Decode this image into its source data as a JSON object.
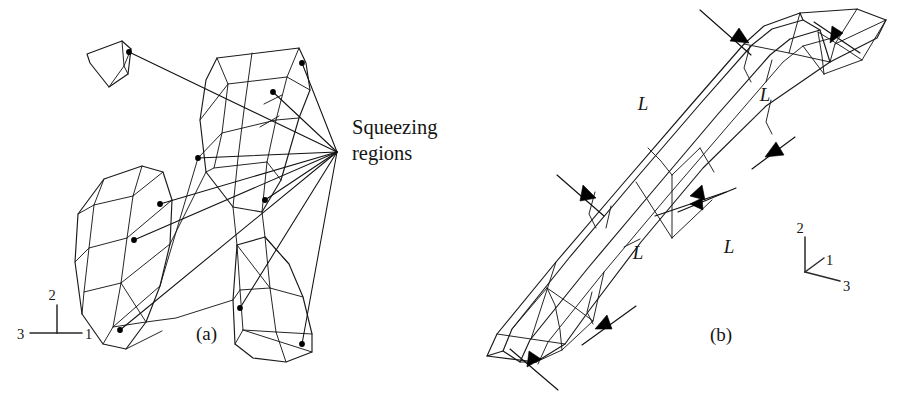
{
  "figure": {
    "background_color": "#ffffff",
    "ink_color": "#1a1a1a",
    "width": 908,
    "height": 400
  },
  "callout": {
    "line1": "Squeezing",
    "line2": "regions",
    "anchor": {
      "x": 337,
      "y": 152
    },
    "text_x": 352,
    "text_y_line1": 134,
    "text_y_line2": 160,
    "leader_count": 10,
    "leader_targets": [
      {
        "x": 129,
        "y": 52,
        "label": "node-upper-left-wedge"
      },
      {
        "x": 302,
        "y": 63,
        "label": "node-center-block-top-right"
      },
      {
        "x": 273,
        "y": 92,
        "label": "node-center-block-mid"
      },
      {
        "x": 198,
        "y": 158,
        "label": "node-center-block-lower-left"
      },
      {
        "x": 265,
        "y": 200,
        "label": "node-center-block-lower"
      },
      {
        "x": 160,
        "y": 204,
        "label": "node-left-block-upper"
      },
      {
        "x": 134,
        "y": 240,
        "label": "node-left-block-lower"
      },
      {
        "x": 120,
        "y": 330,
        "label": "node-left-block-bottom"
      },
      {
        "x": 240,
        "y": 308,
        "label": "node-right-block-upper"
      },
      {
        "x": 302,
        "y": 344,
        "label": "node-right-block-bottom"
      }
    ]
  },
  "panel_a": {
    "label": "(a)",
    "label_x": 196,
    "label_y": 340,
    "axis_triad": {
      "origin": {
        "x": 57,
        "y": 333
      },
      "axes": [
        {
          "name": "2",
          "label": "2",
          "dir": "up",
          "tip_x": 57,
          "tip_y": 305,
          "text_x": 52,
          "text_y": 300
        },
        {
          "name": "1",
          "label": "1",
          "dir": "right",
          "tip_x": 82,
          "tip_y": 333,
          "text_x": 84,
          "text_y": 339
        },
        {
          "name": "3",
          "label": "3",
          "dir": "left",
          "tip_x": 30,
          "tip_y": 333,
          "text_x": 17,
          "text_y": 339
        }
      ]
    }
  },
  "panel_b": {
    "label": "(b)",
    "label_x": 710,
    "label_y": 341,
    "length_labels": [
      {
        "text": "L",
        "x": 643,
        "y": 110,
        "name": "length-label-upper-left"
      },
      {
        "text": "L",
        "x": 765,
        "y": 101,
        "name": "length-label-upper-right"
      },
      {
        "text": "L",
        "x": 638,
        "y": 259,
        "name": "length-label-lower-left"
      },
      {
        "text": "L",
        "x": 729,
        "y": 253,
        "name": "length-label-lower-right"
      }
    ],
    "squeeze_arrow_count": 6,
    "axis_triad": {
      "origin": {
        "x": 805,
        "y": 272
      },
      "axes": [
        {
          "name": "2",
          "label": "2",
          "dir": "up",
          "tip_x": 805,
          "tip_y": 237,
          "text_x": 799,
          "text_y": 233
        },
        {
          "name": "1",
          "label": "1",
          "dir": "up-right",
          "tip_x": 824,
          "tip_y": 258,
          "text_x": 826,
          "text_y": 264
        },
        {
          "name": "3",
          "label": "3",
          "dir": "down-right",
          "tip_x": 840,
          "tip_y": 281,
          "text_x": 843,
          "text_y": 290
        }
      ]
    }
  }
}
